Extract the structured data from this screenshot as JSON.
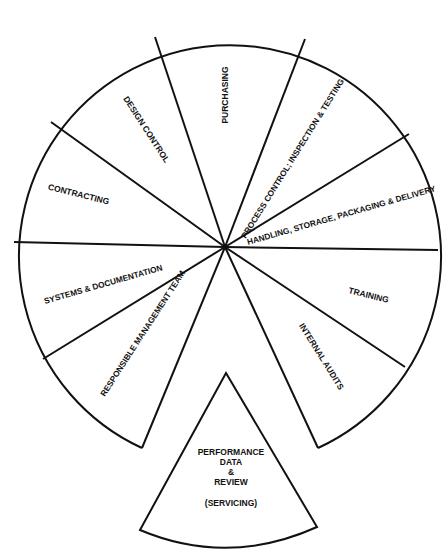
{
  "diagram": {
    "type": "segmented-wheel",
    "center": {
      "x": 225,
      "y": 247
    },
    "radius": 211,
    "line_color": "#111111",
    "background": "#ffffff",
    "segments": [
      {
        "id": "purchasing",
        "label": "PURCHASING"
      },
      {
        "id": "process-control",
        "label": "PROCESS CONTROL; INSPECTION & TESTING"
      },
      {
        "id": "handling",
        "label": "HANDLING, STORAGE, PACKAGING & DELIVERY"
      },
      {
        "id": "training",
        "label": "TRAINING"
      },
      {
        "id": "internal-audits",
        "label": "INTERNAL AUDITS"
      },
      {
        "id": "responsible-management-team",
        "label": "RESPONSIBLE MANAGEMENT TEAM"
      },
      {
        "id": "systems-documentation",
        "label": "SYSTEMS & DOCUMENTATION"
      },
      {
        "id": "contracting",
        "label": "CONTRACTING"
      },
      {
        "id": "design-control",
        "label": "DESIGN CONTROL"
      }
    ],
    "detached_segment": {
      "id": "performance-data-review",
      "lines": [
        "PERFORMANCE",
        "DATA",
        "&",
        "REVIEW",
        "",
        "(SERVICING)"
      ]
    }
  }
}
